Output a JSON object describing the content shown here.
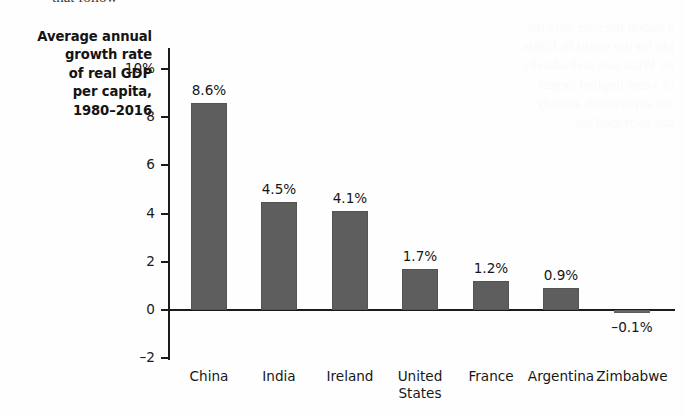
{
  "page": {
    "clipped_top_text": "that follow",
    "showthrough_text": "a nation uncover only the\nple for the world in 1980s\nto. What was undoubtedly\nof years implied largest\nion experiment, namely\nhas increased not"
  },
  "chart_data": {
    "type": "bar",
    "title": "",
    "ylabel": "Average annual growth rate of real GDP per capita, 1980–2016",
    "xlabel": "",
    "categories": [
      "China",
      "India",
      "Ireland",
      "United States",
      "France",
      "Argentina",
      "Zimbabwe"
    ],
    "values": [
      8.6,
      4.5,
      4.1,
      1.7,
      1.2,
      0.9,
      -0.1
    ],
    "value_labels": [
      "8.6%",
      "4.5%",
      "4.1%",
      "1.7%",
      "1.2%",
      "0.9%",
      "–0.1%"
    ],
    "ylim": [
      -2,
      11
    ],
    "yticks": [
      10,
      8,
      6,
      4,
      2,
      0,
      -2
    ],
    "ytick_labels": [
      "10%",
      "8",
      "6",
      "4",
      "2",
      "0",
      "–2"
    ],
    "grid": false,
    "legend": false,
    "bar_color": "#5e5e5e",
    "axis_color": "#1b1b1b"
  },
  "axis_title": {
    "lines": [
      "Average annual",
      "growth rate",
      "of real GDP",
      "per capita,",
      "1980–2016"
    ]
  }
}
